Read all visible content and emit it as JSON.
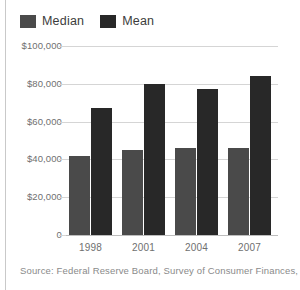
{
  "chart_data": {
    "type": "bar",
    "title": "",
    "xlabel": "",
    "ylabel": "",
    "categories": [
      "1998",
      "2001",
      "2004",
      "2007"
    ],
    "series": [
      {
        "name": "Median",
        "color": "#4a4a4a",
        "values": [
          42000,
          45000,
          46000,
          46000
        ]
      },
      {
        "name": "Mean",
        "color": "#282828",
        "values": [
          67000,
          80000,
          77500,
          84000
        ]
      }
    ],
    "ylim": [
      0,
      100000
    ],
    "ytick_values": [
      100000,
      80000,
      60000,
      40000,
      20000,
      0
    ],
    "ytick_labels": [
      "$100,000",
      "$80,000",
      "$60,000",
      "$40,000",
      "$20,000",
      "0"
    ],
    "grid": true,
    "legend_position": "top-left",
    "annotations": [
      "Source: Federal Reserve Board, Survey of Consumer Finances, 2007"
    ]
  },
  "legend": {
    "entries": [
      {
        "label": "Median",
        "color": "#4a4a4a"
      },
      {
        "label": "Mean",
        "color": "#282828"
      }
    ]
  },
  "source": {
    "text": "Source: Federal Reserve Board, Survey of Consumer Finances, 2007"
  }
}
